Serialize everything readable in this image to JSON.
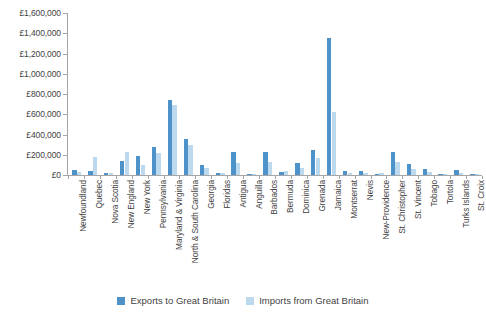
{
  "chart_data": {
    "type": "bar",
    "title": "",
    "subtitle": "",
    "xlabel": "",
    "ylabel": "",
    "ylim": [
      0,
      1600000
    ],
    "ytick_step": 200000,
    "grid": false,
    "legend_position": "bottom-center",
    "currency_symbol": "£",
    "ytick_labels": [
      "£1,600,000",
      "£1,400,000",
      "£1,200,000",
      "£1,000,000",
      "£800,000",
      "£600,000",
      "£400,000",
      "£200,000",
      "£0"
    ],
    "ytick_values": [
      1600000,
      1400000,
      1200000,
      1000000,
      800000,
      600000,
      400000,
      200000,
      0
    ],
    "categories": [
      "Newfoundland",
      "Quebec",
      "Nova Scotia",
      "New England",
      "New York",
      "Pennsylvania",
      "Maryland & Virginia",
      "North & South Carolina",
      "Georgia",
      "Floridas",
      "Antigua",
      "Anguilla",
      "Barbados",
      "Bermuda",
      "Dominica",
      "Grenada",
      "Jamaica",
      "Montserrat",
      "Nevis",
      "New-Providence",
      "St. Christopher",
      "St. Vincent",
      "Tobago",
      "Tortola",
      "Turks Islands",
      "St. Croix"
    ],
    "series": [
      {
        "name": "Exports to Great Britain",
        "color": "#4d93c9",
        "values": [
          50000,
          35000,
          15000,
          140000,
          190000,
          280000,
          740000,
          360000,
          95000,
          15000,
          225000,
          10000,
          225000,
          25000,
          120000,
          250000,
          1355000,
          35000,
          35000,
          12000,
          230000,
          110000,
          55000,
          12000,
          45000,
          8000
        ]
      },
      {
        "name": "Imports from Great Britain",
        "color": "#bcd9ed",
        "values": [
          25000,
          175000,
          18000,
          230000,
          95000,
          215000,
          690000,
          300000,
          65000,
          20000,
          115000,
          8000,
          130000,
          40000,
          65000,
          165000,
          625000,
          18000,
          22000,
          18000,
          130000,
          55000,
          30000,
          10000,
          20000,
          6000
        ]
      }
    ]
  },
  "legend": {
    "items": [
      {
        "label": "Exports to Great Britain",
        "color": "#4d93c9"
      },
      {
        "label": "Imports from Great Britain",
        "color": "#bcd9ed"
      }
    ]
  }
}
